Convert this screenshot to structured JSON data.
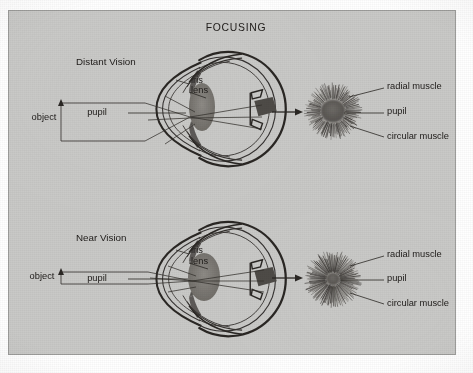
{
  "figure": {
    "title": "FOCUSING",
    "background_color": "#c9c9c7",
    "ink_color": "#2a2724",
    "page_color": "#ffffff"
  },
  "panels": [
    {
      "id": "distant-vision",
      "section_label": "Distant Vision",
      "eye_labels": {
        "object": "object",
        "pupil": "pupil",
        "iris": "iris",
        "lens": "lens"
      },
      "iris_view_labels": {
        "radial_muscle": "radial muscle",
        "pupil": "pupil",
        "circular_muscle": "circular muscle"
      },
      "pupil_state": "dilated"
    },
    {
      "id": "near-vision",
      "section_label": "Near Vision",
      "eye_labels": {
        "object": "object",
        "pupil": "pupil",
        "iris": "iris",
        "lens": "lens"
      },
      "iris_view_labels": {
        "radial_muscle": "radial muscle",
        "pupil": "pupil",
        "circular_muscle": "circular muscle"
      },
      "pupil_state": "constricted"
    }
  ]
}
